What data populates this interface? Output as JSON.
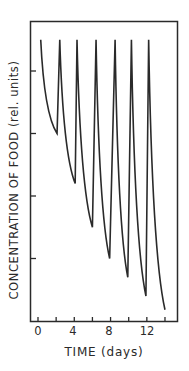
{
  "chart_data": {
    "type": "line",
    "title": "",
    "xlabel": "TIME (days)",
    "ylabel": "CONCENTRATION OF FOOD (rel. units)",
    "xlim": [
      0,
      15
    ],
    "ylim": [
      0,
      4.1
    ],
    "x_tick_labels": [
      "0",
      "4",
      "8",
      "12"
    ],
    "x_ticks": [
      0,
      2,
      4,
      6,
      8,
      10,
      12,
      14
    ],
    "y_ticks_unlabeled": [
      1,
      2,
      3,
      4
    ],
    "grid": false,
    "legend": null,
    "series": [
      {
        "name": "food concentration (sawtooth: periodic feeding then decay)",
        "segments": [
          {
            "peak": {
              "x": 0.3,
              "y": 4.5
            },
            "trough": {
              "x": 2.1,
              "y": 3.0
            }
          },
          {
            "peak": {
              "x": 2.4,
              "y": 4.5
            },
            "trough": {
              "x": 4.1,
              "y": 2.2
            }
          },
          {
            "peak": {
              "x": 4.3,
              "y": 4.5
            },
            "trough": {
              "x": 6.0,
              "y": 1.5
            }
          },
          {
            "peak": {
              "x": 6.4,
              "y": 4.5
            },
            "trough": {
              "x": 7.9,
              "y": 1.0
            }
          },
          {
            "peak": {
              "x": 8.5,
              "y": 4.5
            },
            "trough": {
              "x": 9.9,
              "y": 0.7
            }
          },
          {
            "peak": {
              "x": 10.3,
              "y": 4.5
            },
            "trough": {
              "x": 11.9,
              "y": 0.4
            }
          },
          {
            "peak": {
              "x": 12.2,
              "y": 4.5
            },
            "trough": {
              "x": 14.0,
              "y": 0.18
            }
          }
        ]
      }
    ]
  },
  "labels": {
    "xlabel": "TIME (days)",
    "ylabel": "CONCENTRATION OF FOOD (rel. units)",
    "ticks": [
      "0",
      "4",
      "8",
      "12"
    ]
  },
  "colors": {
    "line": "#2a2a2a",
    "frame": "#2a2a2a",
    "background": "#ffffff"
  }
}
